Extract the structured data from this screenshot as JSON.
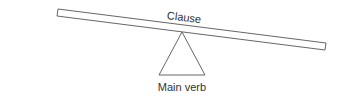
{
  "diagram": {
    "type": "seesaw",
    "plank": {
      "label": "Clause"
    },
    "fulcrum": {
      "label": "Main verb"
    },
    "colors": {
      "stroke": "#555555",
      "text": "#333333",
      "background": "#ffffff"
    }
  }
}
